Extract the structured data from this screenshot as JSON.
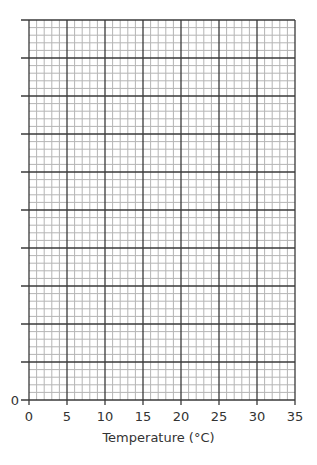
{
  "chart_data": {
    "type": "line",
    "title": "",
    "xlabel": "Temperature (°C)",
    "ylabel": "",
    "x_ticks": [
      0,
      5,
      10,
      15,
      20,
      25,
      30,
      35
    ],
    "y_ticks": [
      "0"
    ],
    "xlim": [
      0,
      35
    ],
    "y_major_divisions": 10,
    "minor_per_major": 5,
    "grid": true,
    "series": [],
    "note": "Blank graph paper grid; only y-axis label 0 is shown"
  },
  "colors": {
    "major": "#3a3a3a",
    "minor": "#b5b5b5",
    "text": "#333333"
  }
}
